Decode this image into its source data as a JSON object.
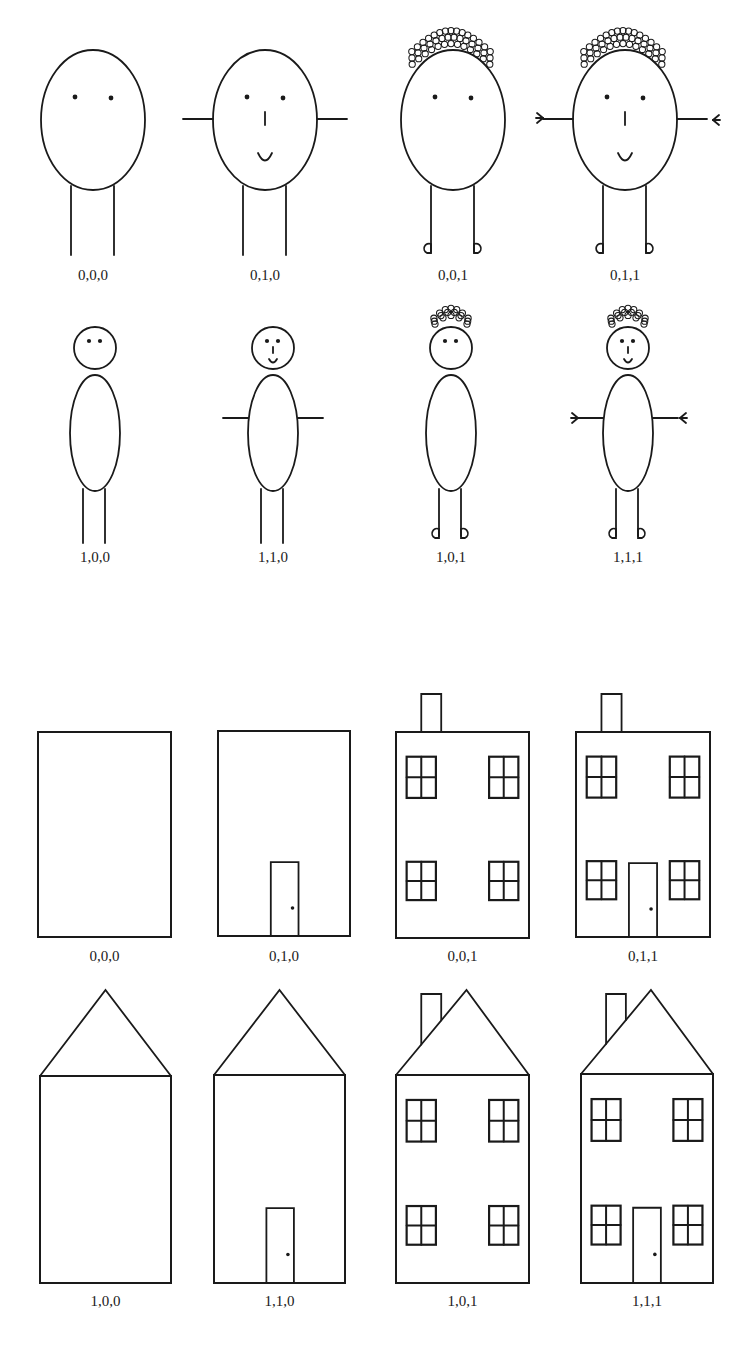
{
  "figure": {
    "ink_color": "#1a1a1a",
    "background": "#ffffff",
    "people": {
      "row1": [
        {
          "label": "0,0,0",
          "face": false,
          "arms": false,
          "hair": false,
          "feet": false
        },
        {
          "label": "0,1,0",
          "face": true,
          "arms": true,
          "hair": false,
          "feet": false
        },
        {
          "label": "0,0,1",
          "face": false,
          "arms": false,
          "hair": true,
          "feet": true
        },
        {
          "label": "0,1,1",
          "face": true,
          "arms": true,
          "hair": true,
          "feet": true
        }
      ],
      "row2": [
        {
          "label": "1,0,0",
          "face": false,
          "arms": false,
          "hair": false,
          "feet": false
        },
        {
          "label": "1,1,0",
          "face": true,
          "arms": true,
          "hair": false,
          "feet": false
        },
        {
          "label": "1,0,1",
          "face": false,
          "arms": false,
          "hair": true,
          "feet": true
        },
        {
          "label": "1,1,1",
          "face": true,
          "arms": true,
          "hair": true,
          "feet": true
        }
      ]
    },
    "houses": {
      "row1": [
        {
          "label": "0,0,0",
          "roof": false,
          "door": false,
          "windows": false,
          "chimney": false
        },
        {
          "label": "0,1,0",
          "roof": false,
          "door": true,
          "windows": false,
          "chimney": false
        },
        {
          "label": "0,0,1",
          "roof": false,
          "door": false,
          "windows": true,
          "chimney": true
        },
        {
          "label": "0,1,1",
          "roof": false,
          "door": true,
          "windows": true,
          "chimney": true
        }
      ],
      "row2": [
        {
          "label": "1,0,0",
          "roof": true,
          "door": false,
          "windows": false,
          "chimney": false
        },
        {
          "label": "1,1,0",
          "roof": true,
          "door": true,
          "windows": false,
          "chimney": false
        },
        {
          "label": "1,0,1",
          "roof": true,
          "door": false,
          "windows": true,
          "chimney": true
        },
        {
          "label": "1,1,1",
          "roof": true,
          "door": true,
          "windows": true,
          "chimney": true
        }
      ]
    },
    "caption_cropped": ""
  }
}
